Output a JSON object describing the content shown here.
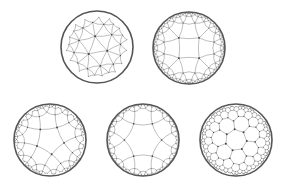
{
  "figure": {
    "colors": {
      "background": "#ffffff",
      "boundary": "#555555",
      "edges": "#8a8a8a",
      "vertices": "#444444"
    }
  },
  "disks": [
    {
      "id": "tiling-1",
      "cx": 97,
      "cy": 47,
      "r": 36,
      "p": 3,
      "q": 7,
      "rotation": 0.35,
      "depth": 4
    },
    {
      "id": "tiling-2",
      "cx": 189,
      "cy": 48,
      "r": 36,
      "p": 4,
      "q": 5,
      "rotation": 0.785,
      "depth": 4
    },
    {
      "id": "tiling-3",
      "cx": 50,
      "cy": 140,
      "r": 36,
      "p": 5,
      "q": 4,
      "rotation": 0.2,
      "depth": 3
    },
    {
      "id": "tiling-4",
      "cx": 143,
      "cy": 140,
      "r": 36,
      "p": 6,
      "q": 4,
      "rotation": 0.0,
      "depth": 3
    },
    {
      "id": "tiling-5",
      "cx": 236,
      "cy": 140,
      "r": 36,
      "p": 7,
      "q": 3,
      "rotation": 0.1,
      "depth": 3
    }
  ]
}
